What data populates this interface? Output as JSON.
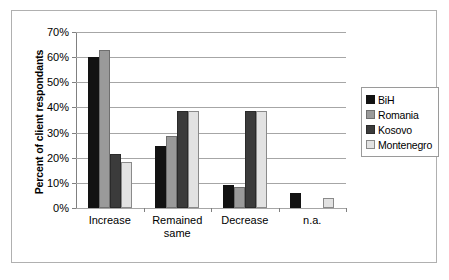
{
  "chart_data": {
    "type": "bar",
    "title": "",
    "xlabel": "",
    "ylabel": "Percent of client respondants",
    "categories": [
      "Increase",
      "Remained\nsame",
      "Decrease",
      "n.a."
    ],
    "series": [
      {
        "name": "BiH",
        "color": "#121212",
        "values": [
          60.0,
          24.5,
          9.0,
          6.0
        ]
      },
      {
        "name": "Romania",
        "color": "#9a9a9a",
        "values": [
          63.0,
          28.5,
          8.5,
          0.0
        ]
      },
      {
        "name": "Kosovo",
        "color": "#3b3b3b",
        "values": [
          21.5,
          38.7,
          38.7,
          0.0
        ]
      },
      {
        "name": "Montenegro",
        "color": "#e2e2e2",
        "values": [
          18.3,
          38.7,
          38.7,
          4.0
        ]
      }
    ],
    "ylim": [
      0,
      70
    ],
    "ytick_values": [
      0,
      10,
      20,
      30,
      40,
      50,
      60,
      70
    ],
    "ytick_labels": [
      "0%",
      "10%",
      "20%",
      "30%",
      "40%",
      "50%",
      "60%",
      "70%"
    ],
    "grid": "horizontal",
    "legend_position": "right"
  },
  "legend": {
    "items": [
      {
        "label": "BiH"
      },
      {
        "label": "Romania"
      },
      {
        "label": "Kosovo"
      },
      {
        "label": "Montenegro"
      }
    ]
  }
}
